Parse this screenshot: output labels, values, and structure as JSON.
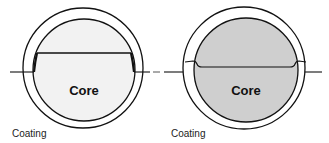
{
  "figure": {
    "panels": [
      {
        "id": "left",
        "core_label": "Core",
        "coating_label": "Coating",
        "core_fill": "#f2f2f2",
        "coating_fill": "#ffffff"
      },
      {
        "id": "right",
        "core_label": "Core",
        "coating_label": "Coating",
        "core_fill": "#cfcfcf",
        "coating_fill": "#ffffff"
      }
    ],
    "stroke_color": "#111111"
  }
}
